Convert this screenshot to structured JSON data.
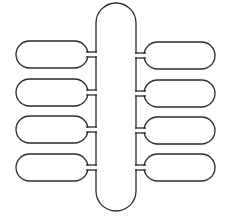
{
  "diagram": {
    "width": 228,
    "height": 219,
    "stroke_color": "#2a2a2a",
    "background": "#ffffff",
    "central_capsule": {
      "x": 96,
      "y": 3,
      "width": 40,
      "height": 208
    },
    "neck": {
      "gap": 5,
      "length": 8
    },
    "left_pills": [
      {
        "x": 16,
        "y": 41,
        "width": 72,
        "height": 27
      },
      {
        "x": 16,
        "y": 79,
        "width": 72,
        "height": 27
      },
      {
        "x": 16,
        "y": 116,
        "width": 72,
        "height": 27
      },
      {
        "x": 16,
        "y": 154,
        "width": 72,
        "height": 27
      }
    ],
    "right_pills": [
      {
        "x": 144,
        "y": 42,
        "width": 71,
        "height": 27
      },
      {
        "x": 144,
        "y": 80,
        "width": 71,
        "height": 27
      },
      {
        "x": 144,
        "y": 117,
        "width": 71,
        "height": 27
      },
      {
        "x": 144,
        "y": 154,
        "width": 71,
        "height": 27
      }
    ]
  }
}
